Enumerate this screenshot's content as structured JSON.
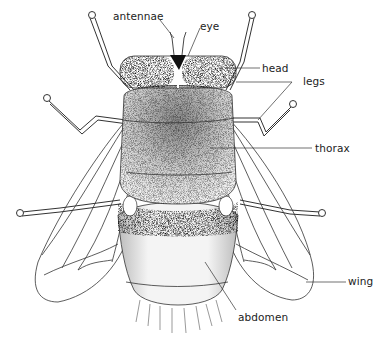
{
  "diagram": {
    "labels": {
      "antennae": "antennae",
      "eye": "eye",
      "head": "head",
      "legs": "legs",
      "thorax": "thorax",
      "wing": "wing",
      "abdomen": "abdomen"
    },
    "colors": {
      "ink": "#222222",
      "background": "#ffffff"
    }
  }
}
